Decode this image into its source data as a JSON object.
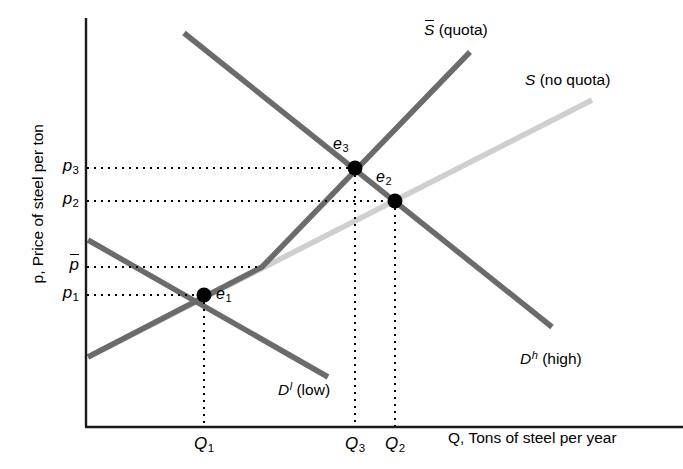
{
  "figure": {
    "type": "supply-demand-quota-diagram",
    "background": "#ffffff"
  },
  "axes": {
    "y_title": "p, Price of steel per ton",
    "x_title": "Q, Tons of steel per year",
    "axis_color": "#1a1a1a",
    "origin": {
      "x": 87,
      "y": 427
    },
    "y_top": 18,
    "x_right": 683
  },
  "price_ticks": [
    {
      "id": "p3",
      "label": "p",
      "sub": "3",
      "bar": false,
      "y": 168
    },
    {
      "id": "p2",
      "label": "p",
      "sub": "2",
      "bar": false,
      "y": 201
    },
    {
      "id": "pbar",
      "label": "p",
      "sub": "",
      "bar": true,
      "y": 267
    },
    {
      "id": "p1",
      "label": "p",
      "sub": "1",
      "bar": false,
      "y": 295
    }
  ],
  "quantity_ticks": [
    {
      "id": "Q1",
      "label": "Q",
      "sub": "1",
      "x": 204
    },
    {
      "id": "Q3",
      "label": "Q",
      "sub": "3",
      "x": 355
    },
    {
      "id": "Q2",
      "label": "Q",
      "sub": "2",
      "x": 395
    }
  ],
  "equilibria": [
    {
      "id": "e1",
      "label": "e",
      "sub": "1",
      "x": 204,
      "y": 295,
      "label_x": 216,
      "label_y": 286
    },
    {
      "id": "e3",
      "label": "e",
      "sub": "3",
      "x": 355,
      "y": 168,
      "label_x": 333,
      "label_y": 136
    },
    {
      "id": "e2",
      "label": "e",
      "sub": "2",
      "x": 395,
      "y": 201,
      "label_x": 376,
      "label_y": 169
    }
  ],
  "curves": [
    {
      "id": "S_quota",
      "symbol": "S",
      "bar": true,
      "superscript": "",
      "note": "(quota)",
      "color": "#6b6b6b",
      "width": 5.5,
      "label_x": 424,
      "label_y": 22,
      "points": [
        [
          88,
          357
        ],
        [
          262,
          267
        ],
        [
          470,
          52
        ]
      ]
    },
    {
      "id": "S_noquota",
      "symbol": "S",
      "bar": false,
      "superscript": "",
      "note": "(no quota)",
      "color": "#cfcfcf",
      "width": 5.5,
      "label_x": 525,
      "label_y": 72,
      "points": [
        [
          88,
          357
        ],
        [
          592,
          100
        ]
      ]
    },
    {
      "id": "D_high",
      "symbol": "D",
      "bar": false,
      "superscript": "h",
      "note": "(high)",
      "color": "#6b6b6b",
      "width": 5.5,
      "label_x": 520,
      "label_y": 350,
      "points": [
        [
          184,
          33
        ],
        [
          552,
          327
        ]
      ]
    },
    {
      "id": "D_low",
      "symbol": "D",
      "bar": false,
      "superscript": "l",
      "note": "(low)",
      "color": "#6b6b6b",
      "width": 5.5,
      "label_x": 278,
      "label_y": 381,
      "points": [
        [
          88,
          240
        ],
        [
          328,
          377
        ]
      ]
    }
  ],
  "guide_lines": {
    "color": "#000000",
    "style": "dotted",
    "horizontal": [
      {
        "from_x": 87,
        "to_x": 355,
        "y": 168,
        "tick": "p3"
      },
      {
        "from_x": 87,
        "to_x": 395,
        "y": 201,
        "tick": "p2"
      },
      {
        "from_x": 87,
        "to_x": 262,
        "y": 267,
        "tick": "pbar"
      },
      {
        "from_x": 87,
        "to_x": 204,
        "y": 295,
        "tick": "p1"
      }
    ],
    "vertical": [
      {
        "x": 204,
        "from_y": 295,
        "to_y": 427,
        "tick": "Q1"
      },
      {
        "x": 355,
        "from_y": 168,
        "to_y": 427,
        "tick": "Q3"
      },
      {
        "x": 395,
        "from_y": 201,
        "to_y": 427,
        "tick": "Q2"
      }
    ]
  },
  "chart_data": {
    "type": "line",
    "title": "",
    "xlabel": "Q, Tons of steel per year",
    "ylabel": "p, Price of steel per ton",
    "grid": false,
    "legend": "inline-curve-labels",
    "series": [
      {
        "name": "S (no quota)",
        "color": "#cfcfcf",
        "description": "upward sloping linear supply curve without quota"
      },
      {
        "name": "S-bar (quota)",
        "color": "#6b6b6b",
        "description": "supply curve with import quota; coincides with S up to p-bar then becomes steeper"
      },
      {
        "name": "D-l (low)",
        "color": "#6b6b6b",
        "description": "low demand curve, downward sloping"
      },
      {
        "name": "D-h (high)",
        "color": "#6b6b6b",
        "description": "high demand curve, downward sloping, to the right of D-l"
      }
    ],
    "annotations": [
      {
        "name": "e1",
        "x_tick": "Q1",
        "y_tick": "p1",
        "meaning": "equilibrium of low demand with supply (quota not binding)"
      },
      {
        "name": "e2",
        "x_tick": "Q2",
        "y_tick": "p2",
        "meaning": "equilibrium of high demand with supply if no quota"
      },
      {
        "name": "e3",
        "x_tick": "Q3",
        "y_tick": "p3",
        "meaning": "equilibrium of high demand with quota-restricted supply"
      }
    ]
  }
}
